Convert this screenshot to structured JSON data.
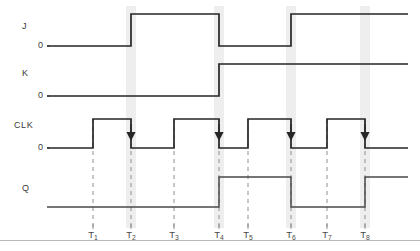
{
  "diagram": {
    "canvas": {
      "width": 420,
      "height": 251
    },
    "colors": {
      "waveform_input": "#262626",
      "waveform_output": "#4a4a4a",
      "dashed_guide": "#8f8f8f",
      "highlight_band": "#ebebeb",
      "text": "#3a3a3a",
      "rule": "#b9b9b9",
      "background": "#ffffff"
    },
    "signals": [
      {
        "name": "J",
        "label": "J",
        "zero_label": "0",
        "label_x": 22,
        "label_y": 21,
        "zero_x": 38,
        "baseline_y": 46,
        "high_y": 14,
        "kind": "input",
        "start_level": 0,
        "transitions": [
          {
            "at": "T2",
            "x": 131,
            "to": 1
          },
          {
            "at": "T4",
            "x": 219,
            "to": 0
          },
          {
            "at": "T6",
            "x": 291,
            "to": 1
          }
        ],
        "end_level": 1
      },
      {
        "name": "K",
        "label": "K",
        "zero_label": "0",
        "label_x": 22,
        "label_y": 68,
        "zero_x": 38,
        "baseline_y": 96,
        "high_y": 64,
        "kind": "input",
        "start_level": 0,
        "transitions": [
          {
            "at": "T4",
            "x": 219,
            "to": 1
          }
        ],
        "end_level": 1
      },
      {
        "name": "CLK",
        "label": "CLK",
        "zero_label": "0",
        "label_x": 14,
        "label_y": 120,
        "zero_x": 38,
        "baseline_y": 148,
        "high_y": 119,
        "kind": "clock",
        "start_level": 0,
        "transitions": [
          {
            "at": "T1",
            "x": 93,
            "to": 1
          },
          {
            "at": "T2",
            "x": 131,
            "to": 0
          },
          {
            "at": "T3",
            "x": 174,
            "to": 1
          },
          {
            "at": "T4",
            "x": 219,
            "to": 0
          },
          {
            "at": "T5",
            "x": 248,
            "to": 1
          },
          {
            "at": "T6",
            "x": 291,
            "to": 0
          },
          {
            "at": "T7",
            "x": 327,
            "to": 1
          },
          {
            "at": "T8",
            "x": 365,
            "to": 0
          }
        ],
        "end_level": 0
      },
      {
        "name": "Q",
        "label": "Q",
        "zero_label": "",
        "label_x": 22,
        "label_y": 183,
        "zero_x": 38,
        "baseline_y": 207,
        "high_y": 177,
        "kind": "output",
        "start_level": 0,
        "transitions": [
          {
            "at": "T4",
            "x": 219,
            "to": 1
          },
          {
            "at": "T6",
            "x": 291,
            "to": 0
          },
          {
            "at": "T8",
            "x": 365,
            "to": 1
          }
        ],
        "end_level": 1
      }
    ],
    "time_markers": [
      {
        "id": "T1",
        "label": "T",
        "sub": "1",
        "x": 93
      },
      {
        "id": "T2",
        "label": "T",
        "sub": "2",
        "x": 131
      },
      {
        "id": "T3",
        "label": "T",
        "sub": "3",
        "x": 174
      },
      {
        "id": "T4",
        "label": "T",
        "sub": "4",
        "x": 219
      },
      {
        "id": "T5",
        "label": "T",
        "sub": "5",
        "x": 248
      },
      {
        "id": "T6",
        "label": "T",
        "sub": "6",
        "x": 291
      },
      {
        "id": "T7",
        "label": "T",
        "sub": "7",
        "x": 327
      },
      {
        "id": "T8",
        "label": "T",
        "sub": "8",
        "x": 365
      }
    ],
    "highlight_bands": [
      {
        "at": "T2",
        "x": 126,
        "width": 10
      },
      {
        "at": "T4",
        "x": 214,
        "width": 10
      },
      {
        "at": "T6",
        "x": 286,
        "width": 10
      },
      {
        "at": "T8",
        "x": 360,
        "width": 10
      }
    ],
    "trigger_arrows": [
      {
        "at": "T2",
        "x": 131,
        "y_tip": 141
      },
      {
        "at": "T4",
        "x": 219,
        "y_tip": 141
      },
      {
        "at": "T6",
        "x": 291,
        "y_tip": 141
      },
      {
        "at": "T8",
        "x": 365,
        "y_tip": 141
      }
    ],
    "geometry": {
      "wave_left_x": 50,
      "wave_right_x": 408,
      "guide_top_y": 119,
      "guide_bottom_y": 228,
      "axis_rule_y": 240,
      "tick_label_y": 229
    }
  }
}
